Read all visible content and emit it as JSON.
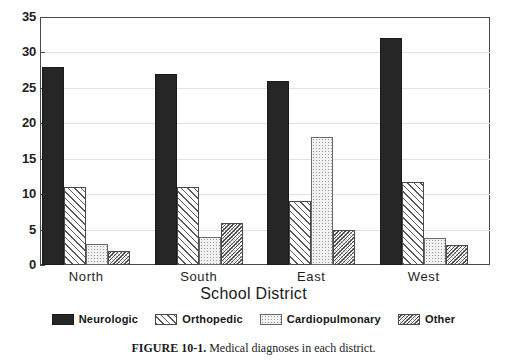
{
  "figure": {
    "caption_label": "FIGURE 10-1.",
    "caption_text": "Medical diagnoses in each district."
  },
  "axis": {
    "xlabel": "School District",
    "ylabel": "",
    "yticks": [
      "35",
      "30",
      "25",
      "20",
      "15",
      "10",
      "5",
      "0"
    ]
  },
  "legend": {
    "items": [
      {
        "label": "Neurologic",
        "pattern": "solid-black",
        "color": "#262626"
      },
      {
        "label": "Orthopedic",
        "pattern": "forward-diagonal-hatch",
        "color": "#585858"
      },
      {
        "label": "Cardiopulmonary",
        "pattern": "light-dotted",
        "color": "#f2f2f2"
      },
      {
        "label": "Other",
        "pattern": "dense-backward-diagonal-hatch",
        "color": "#4f4f4f"
      }
    ]
  },
  "chart_data": {
    "type": "bar",
    "title": "",
    "subtitle": "",
    "xlabel": "School District",
    "ylabel": "",
    "ylim": [
      0,
      35
    ],
    "ytick_step": 5,
    "grid": true,
    "legend_position": "bottom",
    "categories": [
      "North",
      "South",
      "East",
      "West"
    ],
    "series": [
      {
        "name": "Neurologic",
        "values": [
          28,
          27,
          26,
          32
        ]
      },
      {
        "name": "Orthopedic",
        "values": [
          11,
          11,
          9,
          11.7
        ]
      },
      {
        "name": "Cardiopulmonary",
        "values": [
          3,
          4,
          18,
          3.8
        ]
      },
      {
        "name": "Other",
        "values": [
          2,
          6,
          5,
          2.8
        ]
      }
    ]
  }
}
